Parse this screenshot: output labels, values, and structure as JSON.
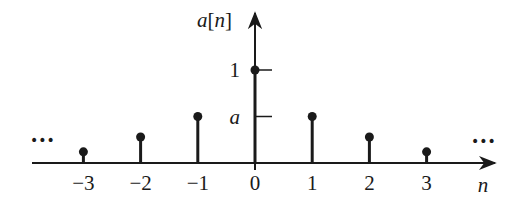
{
  "chart_data": {
    "type": "stem",
    "title": "",
    "ylabel": "a[n]",
    "xlabel": "n",
    "categories": [
      -3,
      -2,
      -1,
      0,
      1,
      2,
      3
    ],
    "x_tick_labels": [
      "−3",
      "−2",
      "−1",
      "0",
      "1",
      "2",
      "3"
    ],
    "values": [
      0.12,
      0.28,
      0.5,
      1,
      0.5,
      0.28,
      0.12
    ],
    "y_ticks": [
      {
        "value": 1,
        "label": "1"
      },
      {
        "value": 0.5,
        "label": "a"
      }
    ],
    "annotations": {
      "left_ellipsis": "•••",
      "right_ellipsis": "•••"
    },
    "expression": "a^|n|",
    "grid": false,
    "legend": "none",
    "colors": {
      "ink": "#1a1a1a",
      "background": "#ffffff"
    }
  }
}
